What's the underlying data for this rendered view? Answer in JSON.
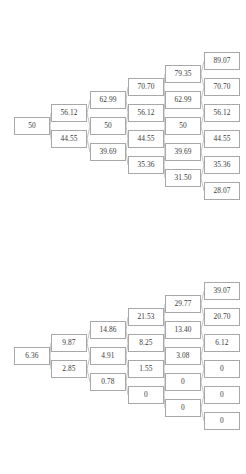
{
  "diagram": {
    "type": "binomial-lattice-pair",
    "node_box": {
      "width": 36,
      "height": 18
    },
    "vertical_spacing": 26,
    "column_x": [
      14,
      51,
      90,
      128,
      165,
      204
    ],
    "trees": [
      {
        "name": "underlying-price-lattice",
        "center_y": 126,
        "steps": 5,
        "columns": [
          {
            "step": 0,
            "values": [
              "50"
            ]
          },
          {
            "step": 1,
            "values": [
              "56.12",
              "44.55"
            ]
          },
          {
            "step": 2,
            "values": [
              "62.99",
              "50",
              "39.69"
            ]
          },
          {
            "step": 3,
            "values": [
              "70.70",
              "56.12",
              "44.55",
              "35.36"
            ]
          },
          {
            "step": 4,
            "values": [
              "79.35",
              "62.99",
              "50",
              "39.69",
              "31.50"
            ]
          },
          {
            "step": 5,
            "values": [
              "89.07",
              "70.70",
              "56.12",
              "44.55",
              "35.36",
              "28.07"
            ]
          }
        ]
      },
      {
        "name": "option-value-lattice",
        "center_y": 356,
        "steps": 5,
        "columns": [
          {
            "step": 0,
            "values": [
              "6.36"
            ]
          },
          {
            "step": 1,
            "values": [
              "9.87",
              "2.85"
            ]
          },
          {
            "step": 2,
            "values": [
              "14.86",
              "4.91",
              "0.78"
            ]
          },
          {
            "step": 3,
            "values": [
              "21.53",
              "8.25",
              "1.55",
              "0"
            ]
          },
          {
            "step": 4,
            "values": [
              "29.77",
              "13.40",
              "3.08",
              "0",
              "0"
            ]
          },
          {
            "step": 5,
            "values": [
              "39.07",
              "20.70",
              "6.12",
              "0",
              "0",
              "0"
            ]
          }
        ]
      }
    ]
  },
  "colors": {
    "border": "#a8a8a8",
    "edge": "#a8a8a8",
    "text": "#3a3a3a",
    "background": "#ffffff"
  }
}
